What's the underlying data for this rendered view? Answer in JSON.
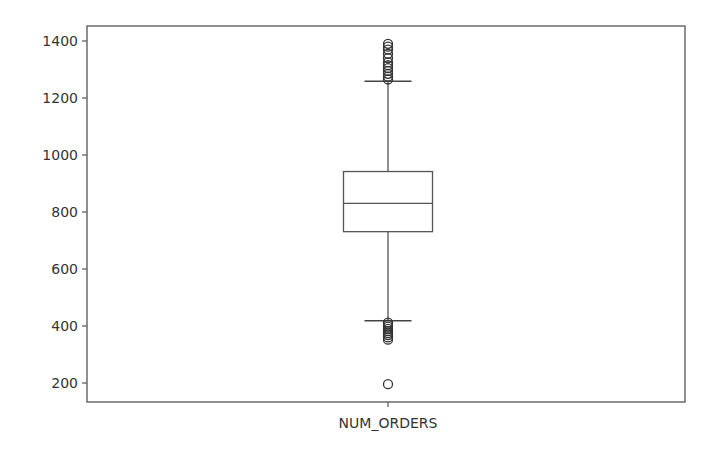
{
  "chart_data": {
    "type": "box",
    "title": "",
    "xlabel": "",
    "ylabel": "",
    "categories": [
      "NUM_ORDERS"
    ],
    "ylim": [
      140,
      1440
    ],
    "yticks": [
      200,
      400,
      600,
      800,
      1000,
      1200,
      1400
    ],
    "grid": false,
    "legend": null,
    "series": [
      {
        "name": "NUM_ORDERS",
        "whisker_low": 418,
        "q1": 731,
        "median": 830,
        "q3": 942,
        "whisker_high": 1259,
        "outliers_high": [
          1265,
          1275,
          1285,
          1295,
          1305,
          1315,
          1325,
          1340,
          1355,
          1370,
          1380,
          1390
        ],
        "outliers_low": [
          412,
          405,
          398,
          390,
          382,
          375,
          368,
          360,
          352
        ],
        "outliers_extreme_low": [
          196
        ]
      }
    ]
  },
  "colors": {
    "frame": "#555555",
    "box": "#555555",
    "median": "#555555",
    "whisker": "#444444",
    "outlier": "#333333",
    "text": "#333333"
  }
}
